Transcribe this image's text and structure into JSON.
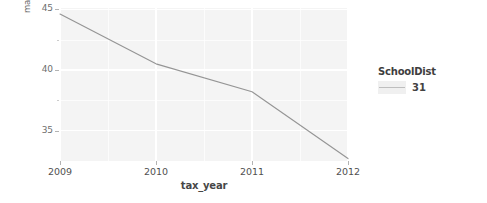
{
  "chart_data": {
    "type": "line",
    "title": "",
    "xlabel": "tax_year",
    "ylabel": "market_value_per_sqft",
    "x": [
      2009,
      2010,
      2011,
      2012
    ],
    "xlim": [
      2009,
      2012
    ],
    "ylim": [
      32.5,
      45.1
    ],
    "yticks": [
      35,
      40,
      45
    ],
    "ytick_labels": [
      "35",
      "40",
      "45"
    ],
    "y_minor_ticks": [
      37.5,
      42.5
    ],
    "xticks": [
      2009,
      2010,
      2011,
      2012
    ],
    "xtick_labels": [
      "2009",
      "2010",
      "2011",
      "2012"
    ],
    "x_minor_ticks": [
      2009.5,
      2010.5,
      2011.5
    ],
    "grid": true,
    "legend_position": "right",
    "legend_title": "SchoolDist",
    "series": [
      {
        "name": "31",
        "values": [
          44.6,
          40.5,
          38.2,
          32.7
        ]
      }
    ]
  },
  "axes": {
    "y_title": "market_value_per_sqft",
    "x_title": "tax_year",
    "y_tick_labels": [
      "45",
      "40",
      "35"
    ],
    "x_tick_labels": [
      "2009",
      "2010",
      "2011",
      "2012"
    ]
  },
  "legend": {
    "title": "SchoolDist",
    "entries": [
      {
        "label": "31",
        "icon": "line-key-icon"
      }
    ]
  },
  "colors": {
    "panel_background": "#ebebeb",
    "gridline": "#ffffff",
    "series_line": "#6f6f6f",
    "text": "#2b2b2b",
    "page_background": "#ffffff"
  }
}
